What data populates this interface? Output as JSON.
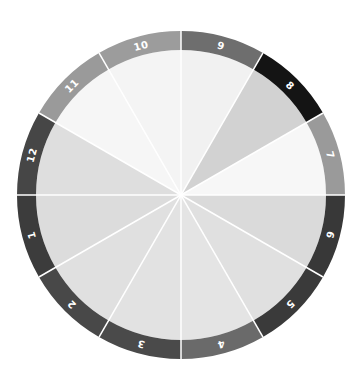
{
  "diagram": {
    "type": "segmented-wheel",
    "center": [
      181,
      195
    ],
    "outer_radius": 164,
    "inner_radius": 145,
    "divider_color": "#ffffff",
    "segments": [
      {
        "label": "7",
        "start_deg": 0,
        "end_deg": 30,
        "ring_color": "#9a9a9a",
        "wedge_color": "#f7f7f7"
      },
      {
        "label": "8",
        "start_deg": 30,
        "end_deg": 60,
        "ring_color": "#141414",
        "wedge_color": "#d2d2d2"
      },
      {
        "label": "9",
        "start_deg": 60,
        "end_deg": 90,
        "ring_color": "#6e6e6e",
        "wedge_color": "#f1f1f1"
      },
      {
        "label": "10",
        "start_deg": 90,
        "end_deg": 120,
        "ring_color": "#9c9c9c",
        "wedge_color": "#f4f4f4"
      },
      {
        "label": "11",
        "start_deg": 120,
        "end_deg": 150,
        "ring_color": "#9a9a9a",
        "wedge_color": "#f6f6f6"
      },
      {
        "label": "12",
        "start_deg": 150,
        "end_deg": 180,
        "ring_color": "#464646",
        "wedge_color": "#dedede"
      },
      {
        "label": "1",
        "start_deg": 180,
        "end_deg": 210,
        "ring_color": "#3c3c3c",
        "wedge_color": "#dcdcdc"
      },
      {
        "label": "2",
        "start_deg": 210,
        "end_deg": 240,
        "ring_color": "#484848",
        "wedge_color": "#e0e0e0"
      },
      {
        "label": "3",
        "start_deg": 240,
        "end_deg": 270,
        "ring_color": "#4a4a4a",
        "wedge_color": "#e2e2e2"
      },
      {
        "label": "4",
        "start_deg": 270,
        "end_deg": 300,
        "ring_color": "#6a6a6a",
        "wedge_color": "#e4e4e4"
      },
      {
        "label": "5",
        "start_deg": 300,
        "end_deg": 330,
        "ring_color": "#3a3a3a",
        "wedge_color": "#e0e0e0"
      },
      {
        "label": "6",
        "start_deg": 330,
        "end_deg": 360,
        "ring_color": "#383838",
        "wedge_color": "#dadada"
      }
    ]
  }
}
